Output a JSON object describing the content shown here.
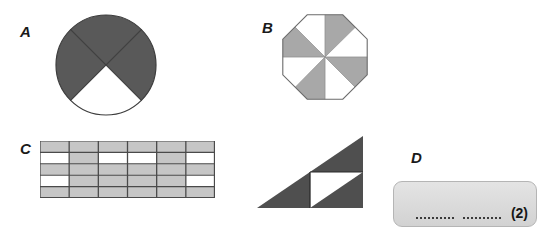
{
  "page": {
    "background_color": "#ffffff",
    "width": 545,
    "height": 240
  },
  "labels": {
    "a": "A",
    "b": "B",
    "c": "C",
    "d": "D"
  },
  "colors": {
    "dark_fill": "#595959",
    "light_fill": "#a8a8a8",
    "grid_fill": "#c6c6c6",
    "white_fill": "#ffffff",
    "outline": "#3d3d3d",
    "grid_line": "#4a4a4a",
    "box_border": "#b5b5b5",
    "box_fill": "#dcdcdc",
    "text": "#1a1a1a"
  },
  "shape_a": {
    "name": "circle-quarters",
    "type": "circle",
    "sector_count": 4,
    "shaded_count": 3,
    "unshaded_count": 1,
    "fraction_shaded": "3/4",
    "sectors": [
      {
        "position": "top",
        "shaded": true
      },
      {
        "position": "right",
        "shaded": true
      },
      {
        "position": "bottom",
        "shaded": false
      },
      {
        "position": "left",
        "shaded": true
      }
    ]
  },
  "shape_b": {
    "name": "octagon-eighths",
    "type": "octagon",
    "sector_count": 8,
    "shaded_count": 4,
    "unshaded_count": 4,
    "fraction_shaded": "4/8",
    "pattern": "alternating",
    "sectors": [
      {
        "index": 1,
        "shaded": false
      },
      {
        "index": 2,
        "shaded": true
      },
      {
        "index": 3,
        "shaded": false
      },
      {
        "index": 4,
        "shaded": true
      },
      {
        "index": 5,
        "shaded": false
      },
      {
        "index": 6,
        "shaded": true
      },
      {
        "index": 7,
        "shaded": false
      },
      {
        "index": 8,
        "shaded": true
      }
    ]
  },
  "shape_c": {
    "name": "rectangle-grid",
    "type": "grid",
    "columns": 6,
    "rows": 5,
    "total_cells": 30,
    "shaded_count": 26,
    "unshaded_count": 4,
    "fraction_shaded": "26/30",
    "cells": [
      [
        1,
        1,
        1,
        1,
        1,
        1
      ],
      [
        0,
        1,
        0,
        0,
        1,
        0
      ],
      [
        1,
        1,
        1,
        1,
        1,
        1
      ],
      [
        0,
        1,
        1,
        1,
        1,
        0
      ],
      [
        1,
        1,
        1,
        1,
        1,
        1
      ]
    ]
  },
  "shape_triangle": {
    "name": "triangle-quarters",
    "type": "right-triangle",
    "part_count": 4,
    "shaded_count": 3,
    "unshaded_count": 1,
    "fraction_shaded": "3/4",
    "parts": [
      {
        "position": "upper",
        "shaded": true
      },
      {
        "position": "lower-left",
        "shaded": true
      },
      {
        "position": "lower-inner",
        "shaded": true
      },
      {
        "position": "right-inner",
        "shaded": false
      }
    ]
  },
  "shape_d": {
    "name": "answer-box",
    "blank_count": 2,
    "blanks": [
      "",
      ""
    ],
    "marks": "(2)"
  }
}
